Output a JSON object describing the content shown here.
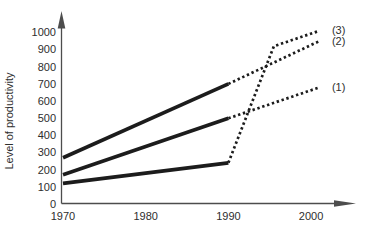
{
  "figure": {
    "background": "#ffffff",
    "data_line_color": "#1c1c1c",
    "axis_color": "#4d4d4d",
    "text_color": "#2e2e2e"
  },
  "chart_data": {
    "type": "line",
    "title": "",
    "xlabel": "",
    "ylabel": "Level of productivity",
    "x_tick_labels": [
      "1970",
      "1980",
      "1990",
      "2000"
    ],
    "x_tick_years": [
      1970,
      1980,
      1990,
      2000
    ],
    "y_tick_labels": [
      "0",
      "100",
      "200",
      "300",
      "400",
      "500",
      "600",
      "700",
      "800",
      "900",
      "1000"
    ],
    "y_tick_values": [
      0,
      100,
      200,
      300,
      400,
      500,
      600,
      700,
      800,
      900,
      1000
    ],
    "xlim": [
      1970,
      2006
    ],
    "ylim": [
      0,
      1120
    ],
    "grid": false,
    "legend_position": "line-end-labels-right",
    "series": [
      {
        "name": "series-2",
        "label": "(2)",
        "solid_points": [
          [
            1970,
            270
          ],
          [
            1990,
            700
          ]
        ],
        "dotted_points": [
          [
            1990,
            700
          ],
          [
            2001,
            950
          ]
        ]
      },
      {
        "name": "series-1",
        "label": "(1)",
        "solid_points": [
          [
            1970,
            170
          ],
          [
            1990,
            500
          ]
        ],
        "dotted_points": [
          [
            1990,
            500
          ],
          [
            2001,
            680
          ]
        ]
      },
      {
        "name": "series-3",
        "label": "(3)",
        "solid_points": [
          [
            1970,
            120
          ],
          [
            1990,
            240
          ]
        ],
        "dotted_points": [
          [
            1990,
            240
          ],
          [
            1995.5,
            920
          ],
          [
            2001,
            1010
          ]
        ]
      }
    ]
  }
}
